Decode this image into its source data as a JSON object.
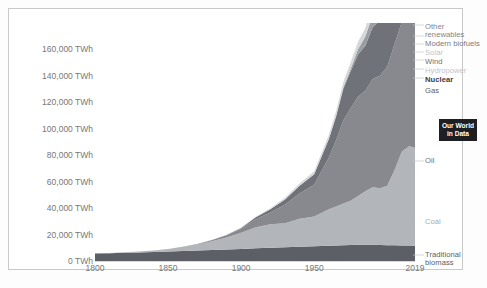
{
  "chart_data": {
    "type": "area",
    "stacked": true,
    "title": "",
    "xlabel": "",
    "ylabel": "",
    "units": "TWh",
    "grid": false,
    "legend_position": "right-inline-labels",
    "xlim": [
      1800,
      2019
    ],
    "ylim": [
      0,
      180000
    ],
    "x_ticks": [
      "1800",
      "1850",
      "1900",
      "1950",
      "2019"
    ],
    "x_tick_values": [
      1800,
      1850,
      1900,
      1950,
      2019
    ],
    "y_ticks": [
      "0 TWh",
      "20,000 TWh",
      "40,000 TWh",
      "60,000 TWh",
      "80,000 TWh",
      "100,000 TWh",
      "120,000 TWh",
      "140,000 TWh",
      "160,000 TWh"
    ],
    "y_tick_values": [
      0,
      20000,
      40000,
      60000,
      80000,
      100000,
      120000,
      140000,
      160000
    ],
    "x": [
      1800,
      1810,
      1820,
      1830,
      1840,
      1850,
      1860,
      1870,
      1880,
      1890,
      1900,
      1910,
      1920,
      1930,
      1940,
      1950,
      1960,
      1965,
      1970,
      1975,
      1980,
      1985,
      1990,
      1995,
      2000,
      2005,
      2010,
      2015,
      2019
    ],
    "series": [
      {
        "name": "Traditional biomass",
        "color": "#5c5f66",
        "values": [
          5600,
          5900,
          6200,
          6500,
          6800,
          7100,
          7500,
          7900,
          8300,
          8700,
          9100,
          9600,
          10000,
          10400,
          10800,
          11200,
          11600,
          11800,
          12000,
          12100,
          12200,
          12200,
          12200,
          12100,
          12000,
          11900,
          11800,
          11700,
          11600
        ]
      },
      {
        "name": "Coal",
        "color": "#b2b5ba",
        "values": [
          100,
          200,
          400,
          700,
          1200,
          2000,
          3100,
          4600,
          6600,
          9100,
          12200,
          16000,
          17700,
          18200,
          21200,
          22400,
          27500,
          29500,
          31500,
          33500,
          37000,
          40500,
          43500,
          43000,
          45000,
          57000,
          71000,
          75000,
          74000
        ]
      },
      {
        "name": "Oil",
        "color": "#87898e",
        "values": [
          0,
          0,
          0,
          0,
          0,
          0,
          100,
          300,
          800,
          1600,
          3000,
          6000,
          9000,
          14000,
          19000,
          24000,
          39000,
          50000,
          63000,
          70000,
          75000,
          76000,
          82000,
          85000,
          90000,
          95000,
          98000,
          102000,
          105000
        ]
      },
      {
        "name": "Gas",
        "color": "#6f7278",
        "values": [
          0,
          0,
          0,
          0,
          0,
          0,
          0,
          0,
          100,
          300,
          700,
          1500,
          2500,
          4000,
          6000,
          8000,
          14000,
          18000,
          24000,
          28000,
          32000,
          34000,
          39000,
          42000,
          46000,
          51000,
          58000,
          62000,
          66000
        ]
      },
      {
        "name": "Nuclear",
        "color": "#9a9da2",
        "values": [
          0,
          0,
          0,
          0,
          0,
          0,
          0,
          0,
          0,
          0,
          0,
          0,
          0,
          0,
          0,
          0,
          200,
          400,
          1000,
          2000,
          4000,
          7000,
          9000,
          10000,
          11000,
          11500,
          11500,
          11000,
          11500
        ]
      },
      {
        "name": "Hydropower",
        "color": "#d5d7da",
        "values": [
          0,
          0,
          0,
          0,
          0,
          0,
          0,
          0,
          0,
          100,
          200,
          400,
          700,
          1200,
          1700,
          2200,
          3000,
          3500,
          4000,
          4600,
          5200,
          5900,
          6500,
          7100,
          7600,
          8100,
          9000,
          10000,
          11000
        ]
      },
      {
        "name": "Wind",
        "color": "#a6a9ae",
        "values": [
          0,
          0,
          0,
          0,
          0,
          0,
          0,
          0,
          0,
          0,
          0,
          0,
          0,
          0,
          0,
          0,
          0,
          0,
          0,
          0,
          0,
          0,
          100,
          200,
          400,
          900,
          2000,
          4000,
          6000
        ]
      },
      {
        "name": "Solar",
        "color": "#dcdee0",
        "values": [
          0,
          0,
          0,
          0,
          0,
          0,
          0,
          0,
          0,
          0,
          0,
          0,
          0,
          0,
          0,
          0,
          0,
          0,
          0,
          0,
          0,
          0,
          0,
          0,
          0,
          100,
          400,
          1500,
          3000
        ]
      },
      {
        "name": "Modern biofuels",
        "color": "#c2c5c9",
        "values": [
          0,
          0,
          0,
          0,
          0,
          0,
          0,
          0,
          0,
          0,
          0,
          0,
          0,
          0,
          0,
          0,
          0,
          0,
          0,
          0,
          100,
          200,
          400,
          600,
          900,
          1300,
          2000,
          2400,
          2700
        ]
      },
      {
        "name": "Other renewables",
        "color": "#cfd1d4",
        "values": [
          0,
          0,
          0,
          0,
          0,
          0,
          0,
          0,
          0,
          0,
          0,
          0,
          0,
          0,
          0,
          0,
          0,
          0,
          100,
          200,
          300,
          500,
          800,
          1000,
          1300,
          1700,
          2200,
          2800,
          3300
        ]
      }
    ]
  },
  "labels": {
    "other_renewables": "Other\nrenewables",
    "modern_biofuels": "Modern biofuels",
    "solar": "Solar",
    "wind": "Wind",
    "hydropower": "Hydropower",
    "nuclear": "Nuclear",
    "gas": "Gas",
    "oil": "Oil",
    "coal": "Coal",
    "traditional_biomass": "Traditional\nbiomass"
  },
  "logo": {
    "text": "Our World\nin Data"
  },
  "colors": {
    "frame": "#c9c9c9",
    "axis_text": "#777777",
    "logo_bg": "#1d1f23",
    "background": "#ffffff"
  }
}
